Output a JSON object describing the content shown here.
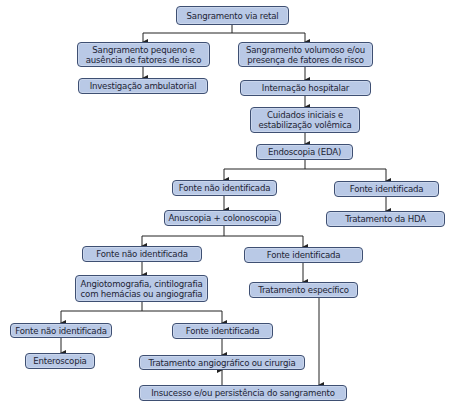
{
  "diagram": {
    "type": "flowchart",
    "colors": {
      "box_fill": "#b9c9e6",
      "box_border": "#3e4f72",
      "line": "#222222"
    },
    "nodes": {
      "n1": "Sangramento via retal",
      "n2a": "Sangramento pequeno e",
      "n2b": "ausência de fatores de risco",
      "n3a": "Sangramento volumoso e/ou",
      "n3b": "presença de fatores de risco",
      "n4": "Investigação ambulatorial",
      "n5": "Internação hospitalar",
      "n6a": "Cuidados iniciais e",
      "n6b": "estabilização volêmica",
      "n7": "Endoscopia (EDA)",
      "n8": "Fonte não identificada",
      "n9": "Fonte identificada",
      "n10": "Tratamento da HDA",
      "n11": "Anuscopia + colonoscopia",
      "n12": "Fonte não identificada",
      "n13": "Fonte identificada",
      "n14a": "Angiotomografia, cintilografia",
      "n14b": "com hemácias ou angiografia",
      "n15": "Tratamento específico",
      "n16": "Fonte não identificada",
      "n17": "Fonte identificada",
      "n18": "Enteroscopia",
      "n19": "Tratamento angiográfico ou cirurgia",
      "n20": "Insucesso e/ou persistência do sangramento"
    }
  }
}
